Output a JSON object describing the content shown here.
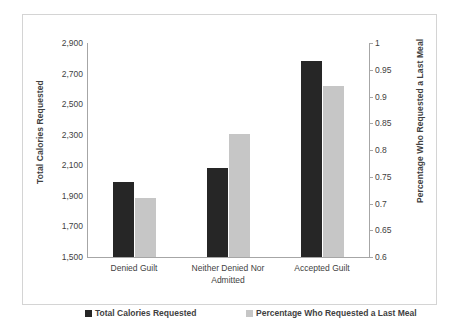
{
  "chart_data": {
    "type": "bar",
    "title": "",
    "subtitle": "",
    "xlabel": "",
    "categories": [
      "Denied Guilt",
      "Neither Denied Nor Admitted",
      "Accepted Guilt"
    ],
    "category_lines": [
      [
        "Denied Guilt"
      ],
      [
        "Neither Denied Nor",
        "Admitted"
      ],
      [
        "Accepted Guilt"
      ]
    ],
    "series": [
      {
        "name": "Total Calories Requested",
        "axis": "left",
        "color": "#262626",
        "values": [
          1990,
          2080,
          2780
        ]
      },
      {
        "name": "Percentage Who Requested a Last Meal",
        "axis": "right",
        "color": "#c6c6c6",
        "values": [
          0.71,
          0.83,
          0.92
        ]
      }
    ],
    "axes": {
      "left": {
        "label": "Total Calories Requested",
        "ylim": [
          1500,
          2900
        ],
        "tick_step": 200,
        "ticks": [
          1500,
          1700,
          1900,
          2100,
          2300,
          2500,
          2700,
          2900
        ],
        "tick_labels": [
          "1,500",
          "1,700",
          "1,900",
          "2,100",
          "2,300",
          "2,500",
          "2,700",
          "2,900"
        ]
      },
      "right": {
        "label": "Percentage Who Requested a Last Meal",
        "ylim": [
          0.6,
          1
        ],
        "tick_step": 0.05,
        "ticks": [
          0.6,
          0.65,
          0.7,
          0.75,
          0.8,
          0.85,
          0.9,
          0.95,
          1
        ],
        "tick_labels": [
          "0.6",
          "0.65",
          "0.7",
          "0.75",
          "0.8",
          "0.85",
          "0.9",
          "0.95",
          "1"
        ]
      }
    },
    "grid": false,
    "legend_position": "bottom",
    "legend": [
      {
        "label": "Total Calories Requested",
        "color": "#262626"
      },
      {
        "label": "Percentage Who Requested a Last Meal",
        "color": "#c6c6c6"
      }
    ],
    "border_color": "#d4d4d4",
    "axis_color": "#a6a6a6",
    "text_color": "#3f3f3f"
  }
}
